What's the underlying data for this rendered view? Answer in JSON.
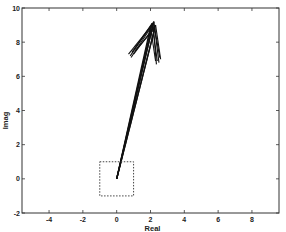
{
  "chart_data": {
    "type": "line",
    "title": "",
    "xlabel": "Real",
    "ylabel": "Imag",
    "xlim": [
      -5.6,
      9.6
    ],
    "ylim": [
      -2,
      10
    ],
    "xticks": [
      -4,
      -2,
      0,
      2,
      4,
      6,
      8
    ],
    "yticks": [
      -2,
      0,
      2,
      4,
      6,
      8,
      10
    ],
    "xtick_labels": [
      "-4",
      "-2",
      "0",
      "2",
      "4",
      "6",
      "8"
    ],
    "ytick_labels": [
      "-2",
      "0",
      "2",
      "4",
      "6",
      "8",
      "10"
    ],
    "grid": false,
    "legend": null,
    "annotations": [
      {
        "type": "dashed-box",
        "x": [
          -1,
          1
        ],
        "y": [
          -1,
          1
        ],
        "description": "unit square around origin"
      }
    ],
    "series": [
      {
        "name": "vector-1",
        "start": [
          0,
          0
        ],
        "end": [
          2.1,
          9.1
        ],
        "head_left": [
          0.9,
          7.4
        ],
        "head_right": [
          2.4,
          6.9
        ]
      },
      {
        "name": "vector-2",
        "start": [
          0,
          0
        ],
        "end": [
          2.2,
          9.2
        ],
        "head_left": [
          0.8,
          7.2
        ],
        "head_right": [
          2.5,
          6.8
        ]
      },
      {
        "name": "vector-3",
        "start": [
          0,
          0
        ],
        "end": [
          2.3,
          9.0
        ],
        "head_left": [
          1.0,
          7.3
        ],
        "head_right": [
          2.6,
          7.0
        ]
      },
      {
        "name": "vector-4",
        "start": [
          0,
          0
        ],
        "end": [
          2.0,
          8.9
        ],
        "head_left": [
          0.7,
          7.3
        ],
        "head_right": [
          2.3,
          6.9
        ]
      },
      {
        "name": "vector-5",
        "start": [
          0,
          0
        ],
        "end": [
          2.25,
          8.8
        ],
        "head_left": [
          1.1,
          7.5
        ],
        "head_right": [
          2.55,
          7.1
        ]
      },
      {
        "name": "vector-6",
        "start": [
          0,
          0
        ],
        "end": [
          2.15,
          9.05
        ],
        "head_left": [
          0.85,
          7.1
        ],
        "head_right": [
          2.35,
          6.7
        ]
      }
    ]
  },
  "colors": {
    "axis": "#333333",
    "series": "#111111",
    "box": "#444444",
    "background": "#ffffff"
  }
}
